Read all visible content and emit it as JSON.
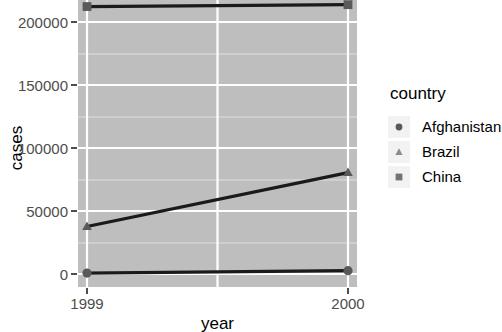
{
  "chart_data": {
    "type": "line",
    "title": "",
    "xlabel": "year",
    "ylabel": "cases",
    "x": [
      1999,
      2000
    ],
    "xlim": [
      1999,
      2000
    ],
    "ylim": [
      0,
      220000
    ],
    "x_tick_labels": [
      "1999",
      "2000"
    ],
    "y_tick_labels": [
      "0",
      "50000",
      "100000",
      "150000",
      "200000"
    ],
    "y_tick_values": [
      0,
      50000,
      100000,
      150000,
      200000
    ],
    "grid": "major and minor white gridlines on gray panel",
    "legend_position": "right",
    "legend_title": "country",
    "series": [
      {
        "name": "Afghanistan",
        "marker": "circle",
        "values": [
          745,
          2666
        ]
      },
      {
        "name": "Brazil",
        "marker": "triangle",
        "values": [
          37737,
          80488
        ]
      },
      {
        "name": "China",
        "marker": "square",
        "values": [
          212258,
          213766
        ]
      }
    ],
    "colors": {
      "panel_background": "#bebebe",
      "gridline_major": "#ffffff",
      "gridline_minor": "#e8e8e8",
      "line": "#1a1a1a",
      "point": "#595959",
      "axis_text": "#4d4d4d",
      "title_text": "#000000",
      "legend_key_background": "#f2f2f2",
      "plot_background": "#ffffff"
    }
  },
  "axis": {
    "y_title": "cases",
    "x_title": "year",
    "y_ticks": [
      {
        "label": "200000"
      },
      {
        "label": "150000"
      },
      {
        "label": "100000"
      },
      {
        "label": "50000"
      },
      {
        "label": "0"
      }
    ],
    "x_ticks": [
      {
        "label": "1999"
      },
      {
        "label": "2000"
      }
    ]
  },
  "legend": {
    "title": "country",
    "items": [
      {
        "label": "Afghanistan",
        "marker": "circle"
      },
      {
        "label": "Brazil",
        "marker": "triangle"
      },
      {
        "label": "China",
        "marker": "square"
      }
    ]
  }
}
